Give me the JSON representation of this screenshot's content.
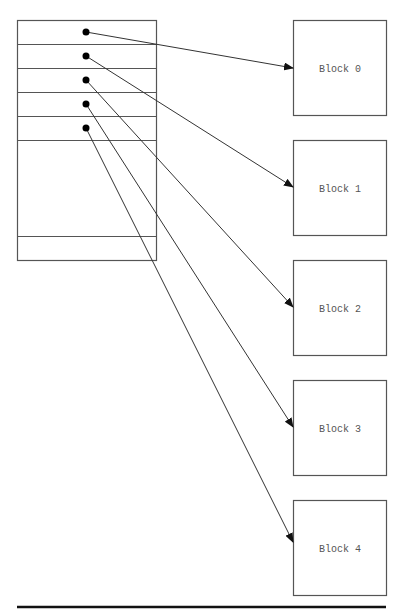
{
  "diagram": {
    "type": "indexed-allocation",
    "colors": {
      "stroke": "#555555",
      "arrow": "#333333",
      "dot": "#000000",
      "rule": "#111111",
      "background": "#ffffff"
    },
    "index_table": {
      "x": 17,
      "y": 20,
      "width": 139,
      "height": 240,
      "row_lines_y": [
        44,
        68,
        92,
        116,
        140,
        236
      ],
      "pointer_entries": 5
    },
    "pointers": [
      {
        "from": [
          86,
          32
        ],
        "to": [
          293,
          68
        ],
        "target": "Block 0"
      },
      {
        "from": [
          86,
          56
        ],
        "to": [
          293,
          187
        ],
        "target": "Block 1"
      },
      {
        "from": [
          86,
          80
        ],
        "to": [
          293,
          307
        ],
        "target": "Block 2"
      },
      {
        "from": [
          86,
          104
        ],
        "to": [
          293,
          427
        ],
        "target": "Block 3"
      },
      {
        "from": [
          86,
          128
        ],
        "to": [
          293,
          542
        ],
        "target": "Block 4"
      }
    ],
    "blocks": [
      {
        "label": "Block 0",
        "x": 293,
        "y": 20,
        "w": 93,
        "h": 95
      },
      {
        "label": "Block 1",
        "x": 293,
        "y": 140,
        "w": 93,
        "h": 95
      },
      {
        "label": "Block 2",
        "x": 293,
        "y": 260,
        "w": 93,
        "h": 95
      },
      {
        "label": "Block 3",
        "x": 293,
        "y": 380,
        "w": 93,
        "h": 95
      },
      {
        "label": "Block 4",
        "x": 293,
        "y": 500,
        "w": 93,
        "h": 95
      }
    ],
    "rule": {
      "x1": 17,
      "x2": 386,
      "y": 607
    }
  }
}
